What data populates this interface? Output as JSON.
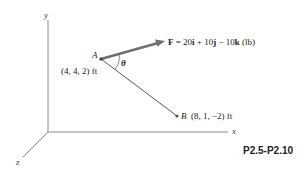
{
  "axes": {
    "x_label": "x",
    "y_label": "y",
    "z_label": "z"
  },
  "points": {
    "A": {
      "name": "A",
      "coords": "(4, 4, 2) ft"
    },
    "B": {
      "name": "B",
      "coords": "(8, 1, −2) ft"
    }
  },
  "force": {
    "symbol": "F",
    "equals": " = ",
    "i_coef": "20",
    "i": "i",
    "j_sep": " + ",
    "j_coef": "10",
    "j": "j",
    "k_sep": " − ",
    "k_coef": "10",
    "k": "k",
    "unit": " (lb)"
  },
  "angle_label": "θ",
  "figure_id": "P2.5-P2.10",
  "colors": {
    "axis": "#7a7a7a",
    "force_arrow": "#6e6e6e",
    "line_ab": "#444444",
    "text": "#222222"
  }
}
